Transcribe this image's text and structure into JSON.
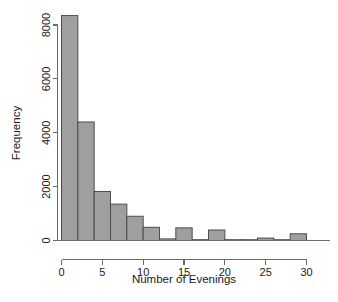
{
  "chart_data": {
    "type": "bar",
    "title": "",
    "subtitle": "",
    "xlabel": "Number of Evenings",
    "ylabel": "Frequency",
    "xlim": [
      -0.5,
      31.5
    ],
    "ylim": [
      0,
      8600
    ],
    "grid": false,
    "legend": null,
    "legend_position": "none",
    "bin_width": 2,
    "xticks": [
      0,
      5,
      10,
      15,
      20,
      25,
      30
    ],
    "xtick_labels": [
      "0",
      "5",
      "10",
      "15",
      "20",
      "25",
      "30"
    ],
    "yticks": [
      0,
      2000,
      4000,
      6000,
      8000
    ],
    "ytick_labels": [
      "0",
      "2000",
      "4000",
      "6000",
      "8000"
    ],
    "bins": [
      {
        "left": 0,
        "right": 2,
        "value": 8350
      },
      {
        "left": 2,
        "right": 4,
        "value": 4400
      },
      {
        "left": 4,
        "right": 6,
        "value": 1820
      },
      {
        "left": 6,
        "right": 8,
        "value": 1350
      },
      {
        "left": 8,
        "right": 10,
        "value": 900
      },
      {
        "left": 10,
        "right": 12,
        "value": 490
      },
      {
        "left": 12,
        "right": 14,
        "value": 60
      },
      {
        "left": 14,
        "right": 16,
        "value": 470
      },
      {
        "left": 16,
        "right": 18,
        "value": 30
      },
      {
        "left": 18,
        "right": 20,
        "value": 390
      },
      {
        "left": 20,
        "right": 22,
        "value": 10
      },
      {
        "left": 22,
        "right": 24,
        "value": 10
      },
      {
        "left": 24,
        "right": 26,
        "value": 90
      },
      {
        "left": 26,
        "right": 28,
        "value": 10
      },
      {
        "left": 28,
        "right": 30,
        "value": 250
      }
    ],
    "categories": [
      "0-2",
      "2-4",
      "4-6",
      "6-8",
      "8-10",
      "10-12",
      "12-14",
      "14-16",
      "16-18",
      "18-20",
      "20-22",
      "22-24",
      "24-26",
      "26-28",
      "28-30"
    ],
    "values": [
      8350,
      4400,
      1820,
      1350,
      900,
      490,
      60,
      470,
      30,
      390,
      10,
      10,
      90,
      10,
      250
    ],
    "colors": {
      "bar_fill": "#9f9f9f",
      "bar_stroke": "#4d4d4d",
      "axis": "#6b6b6b",
      "text": "#1a1a1a",
      "background": "#ffffff"
    }
  }
}
